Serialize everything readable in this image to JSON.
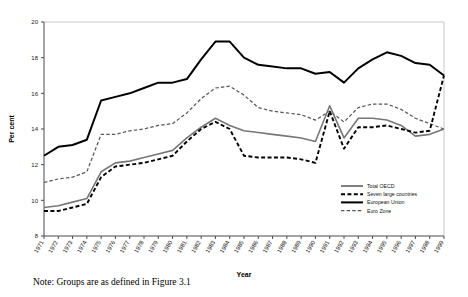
{
  "note": "Note: Groups are as defined in Figure 3.1",
  "axes": {
    "ylabel": "Per cent",
    "xlabel": "Year",
    "yticks": [
      8,
      10,
      12,
      14,
      16,
      18,
      20
    ],
    "ylim": [
      8,
      20
    ]
  },
  "legend": {
    "items": [
      {
        "label": "Total OECD",
        "style": "solid-thin",
        "color": "#000000"
      },
      {
        "label": "Seven large countries",
        "style": "dashed-thick",
        "color": "#000000"
      },
      {
        "label": "European Union",
        "style": "solid-thick",
        "color": "#000000"
      },
      {
        "label": "Euro Zone",
        "style": "dashed-thin",
        "color": "#555555"
      }
    ]
  },
  "chart_data": {
    "type": "line",
    "title": "",
    "xlabel": "Year",
    "ylabel": "Per cent",
    "ylim": [
      8,
      20
    ],
    "grid": false,
    "legend_position": "bottom-right",
    "x": [
      1971,
      1972,
      1973,
      1974,
      1975,
      1976,
      1977,
      1978,
      1979,
      1980,
      1981,
      1982,
      1983,
      1984,
      1985,
      1986,
      1987,
      1988,
      1989,
      1990,
      1991,
      1992,
      1993,
      1994,
      1995,
      1996,
      1997,
      1998,
      1999
    ],
    "categories": [
      "1971",
      "1972",
      "1973",
      "1974",
      "1975",
      "1976",
      "1977",
      "1978",
      "1979",
      "1980",
      "1981",
      "1982",
      "1983",
      "1984",
      "1985",
      "1986",
      "1987",
      "1988",
      "1989",
      "1990",
      "1991",
      "1992",
      "1993",
      "1994",
      "1995",
      "1996",
      "1997",
      "1998",
      "1999"
    ],
    "series": [
      {
        "name": "Total OECD",
        "style": "solid-thick",
        "color": "#000000",
        "values": [
          12.5,
          13.0,
          13.1,
          13.4,
          15.6,
          15.8,
          16.0,
          16.3,
          16.6,
          16.6,
          16.8,
          17.9,
          18.9,
          18.9,
          18.0,
          17.6,
          17.5,
          17.4,
          17.4,
          17.1,
          17.2,
          16.6,
          17.4,
          17.9,
          18.3,
          18.1,
          17.7,
          17.6,
          17.0
        ]
      },
      {
        "name": "Euro Zone",
        "style": "dashed-thin",
        "color": "#555555",
        "values": [
          11.0,
          11.2,
          11.3,
          11.6,
          13.7,
          13.7,
          13.9,
          14.0,
          14.2,
          14.3,
          14.9,
          15.7,
          16.3,
          16.4,
          15.9,
          15.2,
          15.0,
          14.9,
          14.8,
          14.5,
          15.0,
          14.4,
          15.2,
          15.4,
          15.4,
          15.1,
          14.6,
          14.3,
          14.0
        ]
      },
      {
        "name": "European Union",
        "style": "solid-thick-gray",
        "color": "#777777",
        "values": [
          9.6,
          9.7,
          9.9,
          10.1,
          11.6,
          12.1,
          12.2,
          12.4,
          12.6,
          12.8,
          13.5,
          14.1,
          14.6,
          14.2,
          13.9,
          13.8,
          13.7,
          13.6,
          13.5,
          13.3,
          15.3,
          13.5,
          14.6,
          14.6,
          14.5,
          14.2,
          13.6,
          13.7,
          14.0
        ]
      },
      {
        "name": "Seven large countries",
        "style": "dashed-thick",
        "color": "#000000",
        "values": [
          9.4,
          9.4,
          9.6,
          9.8,
          11.3,
          11.9,
          12.0,
          12.1,
          12.3,
          12.5,
          13.3,
          14.0,
          14.4,
          14.0,
          12.5,
          12.4,
          12.4,
          12.4,
          12.3,
          12.1,
          15.0,
          12.9,
          14.1,
          14.1,
          14.2,
          14.0,
          13.8,
          13.9,
          17.0
        ]
      }
    ]
  }
}
